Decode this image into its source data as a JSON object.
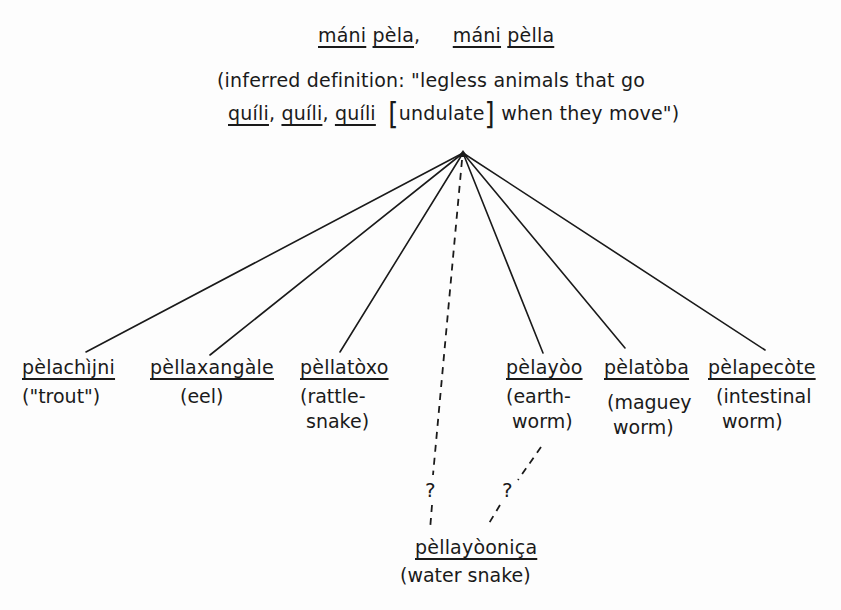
{
  "header": {
    "term_1_a": "máni",
    "term_1_b": "pèla",
    "separator": ",",
    "term_2_a": "máni",
    "term_2_b": "pèlla",
    "definition_line_1": "(inferred definition: \"legless animals that go",
    "definition_q1": "quíli",
    "definition_comma_1": ",",
    "definition_q2": "quíli",
    "definition_comma_2": ",",
    "definition_q3": "quíli",
    "bracket_open": "[",
    "bracket_word": "undulate",
    "bracket_close": "]",
    "definition_tail": "when they move\")"
  },
  "children": [
    {
      "term": "pèlachìjni",
      "gloss": "(\"trout\")"
    },
    {
      "term": "pèllaxangàle",
      "gloss": "(eel)"
    },
    {
      "term": "pèllatòxo",
      "gloss": "(rattle-\n snake)"
    },
    {
      "term": "pèlayòo",
      "gloss": "(earth-\n worm)"
    },
    {
      "term": "pèlatòba",
      "gloss": "(maguey\n worm)"
    },
    {
      "term": "pèlapecòte",
      "gloss": "(intestinal\n worm)"
    }
  ],
  "uncertain_child": {
    "term": "pèllayòoniça",
    "gloss": "(water snake)",
    "question_mark_left": "?",
    "question_mark_right": "?"
  }
}
